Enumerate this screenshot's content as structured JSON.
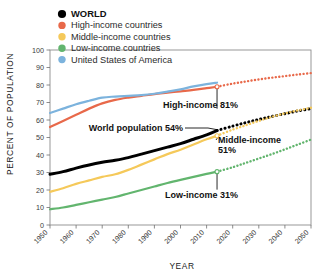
{
  "chart_data": {
    "type": "line",
    "title": "",
    "xlabel": "YEAR",
    "ylabel": "PERCENT OF POPULATION",
    "xlim": [
      1950,
      2050
    ],
    "ylim": [
      0,
      100
    ],
    "grid": false,
    "legend_position": "top-left",
    "x_ticks": [
      "1950",
      "1960",
      "1970",
      "1980",
      "1990",
      "2000",
      "2010",
      "2020",
      "2030",
      "2040",
      "2050"
    ],
    "y_ticks": [
      "0",
      "10",
      "20",
      "30",
      "40",
      "50",
      "60",
      "70",
      "80",
      "90",
      "100"
    ],
    "projection_start_year": 2014,
    "series": [
      {
        "name": "WORLD",
        "color": "#000000",
        "legend_marker": "circle",
        "x": [
          1950,
          1955,
          1960,
          1965,
          1970,
          1975,
          1980,
          1985,
          1990,
          1995,
          2000,
          2005,
          2010,
          2014
        ],
        "values": [
          29.0,
          30.5,
          32.5,
          34.3,
          35.8,
          37.0,
          38.5,
          40.5,
          42.5,
          44.5,
          46.5,
          49.0,
          51.5,
          54.0
        ],
        "projection_x": [
          2014,
          2020,
          2025,
          2030,
          2035,
          2040,
          2045,
          2050
        ],
        "projection_values": [
          54.0,
          56.5,
          58.5,
          60.3,
          62.0,
          63.6,
          65.2,
          66.5
        ]
      },
      {
        "name": "High-income countries",
        "color": "#e8694a",
        "legend_marker": "circle",
        "x": [
          1950,
          1955,
          1960,
          1965,
          1970,
          1975,
          1980,
          1985,
          1990,
          1995,
          2000,
          2005,
          2010,
          2014
        ],
        "values": [
          56.0,
          59.5,
          63.0,
          66.5,
          69.5,
          71.5,
          72.8,
          73.8,
          74.8,
          75.6,
          76.4,
          77.2,
          78.2,
          79.0
        ],
        "projection_x": [
          2014,
          2020,
          2025,
          2030,
          2035,
          2040,
          2045,
          2050
        ],
        "projection_values": [
          79.0,
          80.8,
          82.0,
          83.2,
          84.2,
          85.1,
          86.0,
          86.8
        ]
      },
      {
        "name": "Middle-income countries",
        "color": "#f5c95a",
        "legend_marker": "circle",
        "x": [
          1950,
          1955,
          1960,
          1965,
          1970,
          1975,
          1980,
          1985,
          1990,
          1995,
          2000,
          2005,
          2010,
          2014
        ],
        "values": [
          19.0,
          21.0,
          23.5,
          25.5,
          27.5,
          29.0,
          31.5,
          34.5,
          37.5,
          40.5,
          43.0,
          46.0,
          49.0,
          51.0
        ],
        "projection_x": [
          2014,
          2020,
          2025,
          2030,
          2035,
          2040,
          2045,
          2050
        ],
        "projection_values": [
          51.0,
          54.5,
          57.0,
          59.5,
          61.8,
          63.8,
          65.5,
          67.0
        ]
      },
      {
        "name": "Low-income countries",
        "color": "#62b56e",
        "legend_marker": "circle",
        "x": [
          1950,
          1955,
          1960,
          1965,
          1970,
          1975,
          1980,
          1985,
          1990,
          1995,
          2000,
          2005,
          2010,
          2014
        ],
        "values": [
          9.0,
          10.0,
          11.5,
          13.0,
          14.5,
          16.0,
          18.0,
          20.0,
          22.0,
          24.0,
          25.8,
          27.5,
          29.2,
          30.5
        ],
        "projection_x": [
          2014,
          2020,
          2025,
          2030,
          2035,
          2040,
          2045,
          2050
        ],
        "projection_values": [
          30.5,
          33.0,
          35.5,
          38.0,
          40.5,
          43.2,
          46.0,
          48.8
        ]
      },
      {
        "name": "United States of America",
        "color": "#7cb3dd",
        "legend_marker": "circle",
        "x": [
          1950,
          1955,
          1960,
          1965,
          1970,
          1975,
          1980,
          1985,
          1990,
          1995,
          2000,
          2005,
          2010,
          2014
        ],
        "values": [
          64.0,
          66.5,
          69.0,
          71.0,
          72.8,
          73.4,
          73.8,
          74.2,
          75.0,
          76.2,
          77.5,
          79.2,
          80.5,
          81.3
        ],
        "projection_x": [],
        "projection_values": []
      }
    ],
    "annotations": [
      {
        "text": "High-income 81%",
        "value": 81,
        "series": "High-income countries"
      },
      {
        "text": "World population 54%",
        "value": 54,
        "series": "WORLD"
      },
      {
        "text": "Middle-income",
        "value": 51,
        "series": "Middle-income countries"
      },
      {
        "text": "51%",
        "value": 51,
        "series": "Middle-income countries"
      },
      {
        "text": "Low-income 31%",
        "value": 31,
        "series": "Low-income countries"
      }
    ]
  },
  "legend": {
    "items": [
      {
        "label": "WORLD",
        "color": "#000000"
      },
      {
        "label": "High-income countries",
        "color": "#e8694a"
      },
      {
        "label": "Middle-income countries",
        "color": "#f5c95a"
      },
      {
        "label": "Low-income countries",
        "color": "#62b56e"
      },
      {
        "label": "United States of America",
        "color": "#7cb3dd"
      }
    ]
  },
  "axes": {
    "y_title": "PERCENT OF POPULATION",
    "x_title": "YEAR",
    "y_ticks": [
      "100",
      "90",
      "80",
      "70",
      "60",
      "50",
      "40",
      "30",
      "20",
      "10",
      "0"
    ],
    "x_ticks": [
      "1950",
      "1960",
      "1970",
      "1980",
      "1990",
      "2000",
      "2010",
      "2020",
      "2030",
      "2040",
      "2050"
    ]
  },
  "annotations": {
    "high_income": "High-income 81%",
    "world": "World population 54%",
    "middle_income_line1": "Middle-income",
    "middle_income_line2": "51%",
    "low_income": "Low-income 31%"
  }
}
